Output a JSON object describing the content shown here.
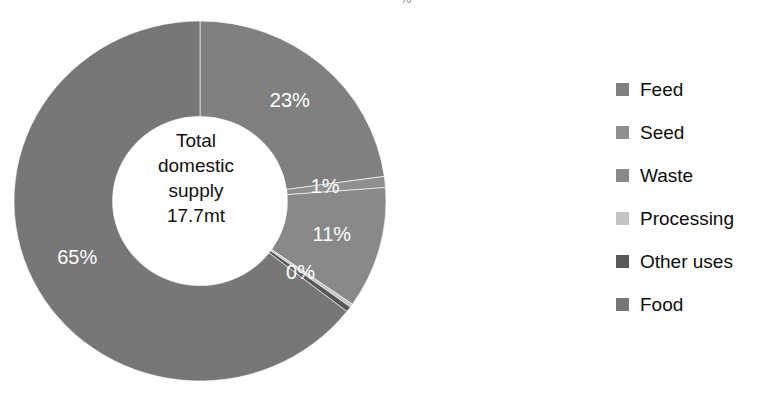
{
  "title_fragment": "% ­",
  "center": {
    "line1": "Total",
    "line2": "domestic",
    "line3": "supply",
    "line4": "17.7mt"
  },
  "legend": {
    "items": [
      {
        "label": "Feed",
        "color": "#808080"
      },
      {
        "label": "Seed",
        "color": "#8f8f8f"
      },
      {
        "label": "Waste",
        "color": "#898989"
      },
      {
        "label": "Processing",
        "color": "#c4c4c4"
      },
      {
        "label": "Other uses",
        "color": "#585858"
      },
      {
        "label": "Food",
        "color": "#777777"
      }
    ]
  },
  "chart_data": {
    "type": "pie",
    "variant": "donut",
    "title": "Total domestic supply 17.7mt",
    "center_label": "Total domestic supply 17.7mt",
    "total": "17.7mt",
    "units": "mt",
    "start_angle_deg": 0,
    "direction": "clockwise",
    "inner_radius_ratio": 0.47,
    "legend_position": "right",
    "categories": [
      "Feed",
      "Seed",
      "Waste",
      "Processing",
      "Other uses",
      "Food"
    ],
    "values": [
      23,
      1,
      11,
      0.3,
      0.5,
      65
    ],
    "display_labels": [
      "23%",
      "1%",
      "11%",
      "",
      "0%",
      "65%"
    ],
    "colors": [
      "#808080",
      "#8f8f8f",
      "#898989",
      "#c4c4c4",
      "#585858",
      "#777777"
    ],
    "label_color": "#ffffff",
    "xlabel": "",
    "ylabel": ""
  }
}
